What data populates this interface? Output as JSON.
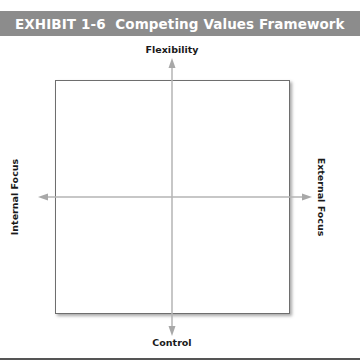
{
  "exhibit": {
    "title": "EXHIBIT 1-6  Competing Values Framework",
    "header_color": "#8c8c8c"
  },
  "diagram": {
    "type": "two-axis quadrant framework",
    "axes": {
      "vertical": {
        "top_label": "Flexibility",
        "bottom_label": "Control"
      },
      "horizontal": {
        "left_label": "Internal Focus",
        "right_label": "External Focus"
      }
    },
    "quadrants": [
      "",
      "",
      "",
      ""
    ],
    "axis_color": "#b5b5b5",
    "box_border_color": "#6e6e6e"
  }
}
